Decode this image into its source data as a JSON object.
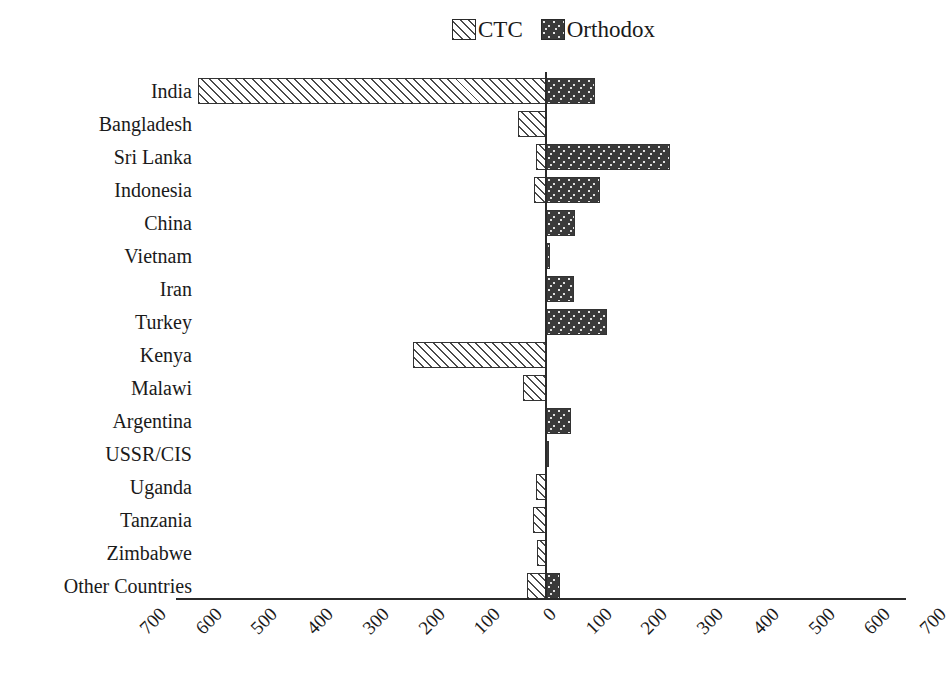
{
  "chart_data": {
    "type": "bar",
    "orientation": "horizontal",
    "subtype": "diverging-bidirectional",
    "title": "",
    "subtitle": "",
    "xlabel": "",
    "ylabel": "",
    "grid": false,
    "legend_position": "top-center",
    "xlim": [
      -700,
      700
    ],
    "xticks": [
      700,
      600,
      500,
      400,
      300,
      200,
      100,
      0,
      100,
      200,
      300,
      400,
      500,
      600,
      700
    ],
    "xtick_labels": [
      "700",
      "600",
      "500",
      "400",
      "300",
      "200",
      "100",
      "0",
      "100",
      "200",
      "300",
      "400",
      "500",
      "600",
      "700"
    ],
    "xtick_rotation": -45,
    "categories": [
      "India",
      "Bangladesh",
      "Sri Lanka",
      "Indonesia",
      "China",
      "Vietnam",
      "Iran",
      "Turkey",
      "Kenya",
      "Malawi",
      "Argentina",
      "USSR/CIS",
      "Uganda",
      "Tanzania",
      "Zimbabwe",
      "Other Countries"
    ],
    "series": [
      {
        "name": "CTC",
        "direction": "left",
        "pattern": "diagonal-hatch",
        "color": "#ffffff",
        "values": [
          625,
          50,
          18,
          21,
          0,
          0,
          0,
          0,
          238,
          41,
          0,
          0,
          18,
          23,
          16,
          34
        ]
      },
      {
        "name": "Orthodox",
        "direction": "right",
        "pattern": "dark-speckle",
        "color": "#3a3a3a",
        "values": [
          88,
          0,
          222,
          97,
          52,
          8,
          50,
          110,
          0,
          0,
          45,
          5,
          0,
          0,
          0,
          25
        ]
      }
    ]
  },
  "legend": {
    "entries": [
      {
        "label": "CTC",
        "swatch": "hatch-swatch"
      },
      {
        "label": "Orthodox",
        "swatch": "speckle-swatch"
      }
    ]
  },
  "axis": {
    "zero_label": "0",
    "left_max": "700",
    "right_max": "700"
  }
}
